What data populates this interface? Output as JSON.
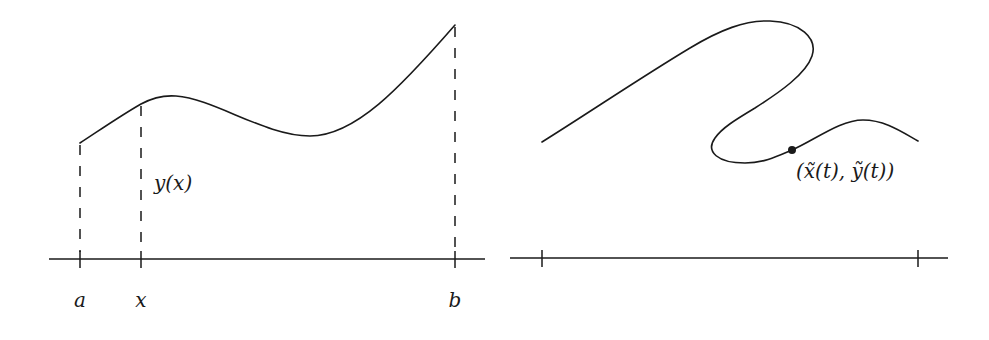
{
  "left_panel": {
    "description": "Graph of a function y(x) over an interval [a, b]",
    "curve_label": "y(x)",
    "axis_labels": {
      "a": "a",
      "x": "x",
      "b": "b"
    }
  },
  "right_panel": {
    "description": "Parametric curve that is not a function graph",
    "point_label": "(x̃(t), ỹ(t))"
  },
  "colors": {
    "ink": "#1a1a1a",
    "background": "#ffffff"
  }
}
